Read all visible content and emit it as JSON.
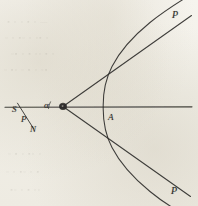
{
  "figure": {
    "caption_visible": false,
    "background_color": "#f2f0e9",
    "ink_color": "#2b2a28",
    "labels": [
      {
        "id": "label-p-top",
        "text": "P",
        "x": 172,
        "y": 10
      },
      {
        "id": "label-p-bottom",
        "text": "P",
        "x": 171,
        "y": 186
      },
      {
        "id": "label-a-vertex",
        "text": "A",
        "x": 108,
        "y": 113
      },
      {
        "id": "label-s",
        "text": "S",
        "x": 12,
        "y": 105
      },
      {
        "id": "label-p-left",
        "text": "P",
        "x": 21,
        "y": 115
      },
      {
        "id": "label-n",
        "text": "N",
        "x": 30,
        "y": 125
      },
      {
        "id": "label-alpha",
        "text": "α",
        "x": 44,
        "y": 101
      }
    ],
    "geometry": {
      "node_point": {
        "name": "focus-node",
        "x": 63,
        "y": 106.5
      },
      "axis_line": {
        "name": "horizontal-axis",
        "x1": 5,
        "y1": 107,
        "x2": 192,
        "y2": 107
      },
      "asymptote_upper": {
        "x1": 63,
        "y1": 106.5,
        "x2": 191,
        "y2": 16
      },
      "asymptote_lower": {
        "x1": 63,
        "y1": 106.5,
        "x2": 190,
        "y2": 196
      },
      "hyperbola_vertex": {
        "x": 103,
        "y": 107
      },
      "transversal_segment": {
        "x1": 17,
        "y1": 103.5,
        "x2": 33,
        "y2": 128
      }
    }
  },
  "bleed_through": {
    "rows": [
      {
        "text": "—  ▫  ▪ ▫  ▫  ▪",
        "x": 6,
        "y": 18,
        "size": 7
      },
      {
        "text": "▫  ▪▫  ▫ ▫▪  ▫  ▫",
        "x": 4,
        "y": 34,
        "size": 7
      },
      {
        "text": "▫ ▪ ▫▫ ▪ ▫  ▪▫",
        "x": 10,
        "y": 50,
        "size": 7
      },
      {
        "text": "▪▫ ▫ ▪  ▫ ▫▪ ▫",
        "x": 3,
        "y": 66,
        "size": 7
      },
      {
        "text": "▫  ▫▪ ▫  ▪ ▫",
        "x": 7,
        "y": 150,
        "size": 7
      },
      {
        "text": "▪ ▫ ▫▪  ▫ ▫",
        "x": 5,
        "y": 168,
        "size": 7
      },
      {
        "text": "▫▫ ▪ ▫  ▫▪",
        "x": 9,
        "y": 186,
        "size": 7
      }
    ]
  }
}
